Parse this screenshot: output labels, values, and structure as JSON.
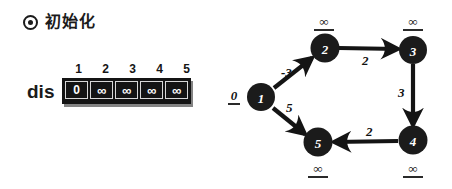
{
  "header": {
    "icon": "target-bullet-icon",
    "title": "初始化"
  },
  "dis_array": {
    "label": "dis",
    "indices": [
      "1",
      "2",
      "3",
      "4",
      "5"
    ],
    "values": [
      "0",
      "∞",
      "∞",
      "∞",
      "∞"
    ]
  },
  "graph": {
    "nodes": [
      {
        "id": "1",
        "label": "1",
        "cx": 35,
        "cy": 97,
        "dist": "0",
        "dist_pos": "left"
      },
      {
        "id": "2",
        "label": "2",
        "cx": 99,
        "cy": 48,
        "dist": "∞",
        "dist_pos": "top"
      },
      {
        "id": "3",
        "label": "3",
        "cx": 187,
        "cy": 50,
        "dist": "∞",
        "dist_pos": "top"
      },
      {
        "id": "4",
        "label": "4",
        "cx": 187,
        "cy": 140,
        "dist": "∞",
        "dist_pos": "bottom"
      },
      {
        "id": "5",
        "label": "5",
        "cx": 92,
        "cy": 142,
        "dist": "∞",
        "dist_pos": "bottom"
      }
    ],
    "edges": [
      {
        "from": "1",
        "to": "2",
        "weight": "-3",
        "lx": 60,
        "ly": 72
      },
      {
        "from": "2",
        "to": "3",
        "weight": "2",
        "lx": 136,
        "ly": 56
      },
      {
        "from": "3",
        "to": "4",
        "weight": "3",
        "lx": 172,
        "ly": 88
      },
      {
        "from": "4",
        "to": "5",
        "weight": "2",
        "lx": 138,
        "ly": 127
      },
      {
        "from": "1",
        "to": "5",
        "weight": "5",
        "lx": 60,
        "ly": 103
      }
    ],
    "node_fill": "#1b1b1b",
    "edge_color": "#141414"
  }
}
